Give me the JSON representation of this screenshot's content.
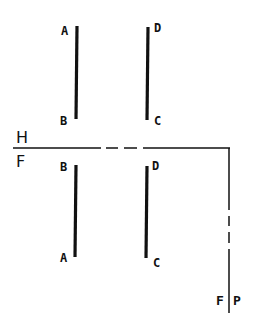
{
  "diagram": {
    "type": "orthographic-projection",
    "plane_labels": {
      "horizontal_above": "H",
      "frontal_below": "F",
      "frontal_side": "F",
      "profile_side": "P"
    },
    "horizontal_view": {
      "segment_ab": {
        "start_label": "A",
        "end_label": "B"
      },
      "segment_dc": {
        "start_label": "D",
        "end_label": "C"
      }
    },
    "frontal_view": {
      "segment_ba": {
        "start_label": "B",
        "end_label": "A"
      },
      "segment_dc": {
        "start_label": "D",
        "end_label": "C"
      }
    },
    "colors": {
      "ink": "#111111",
      "background": "#ffffff"
    }
  }
}
